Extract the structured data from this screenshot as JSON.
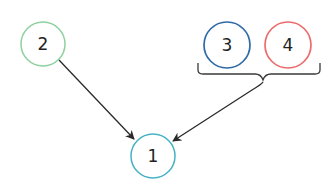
{
  "nodes": [
    {
      "id": "node-1",
      "label": "1",
      "color": "#45b3c4",
      "cx": 153,
      "cy": 156,
      "r": 22
    },
    {
      "id": "node-2",
      "label": "2",
      "color": "#8fd19e",
      "cx": 43,
      "cy": 44,
      "r": 22
    },
    {
      "id": "node-3",
      "label": "3",
      "color": "#2e6aa6",
      "cx": 227,
      "cy": 45,
      "r": 23
    },
    {
      "id": "node-4",
      "label": "4",
      "color": "#ec6b6b",
      "cx": 288,
      "cy": 45,
      "r": 23
    }
  ],
  "edges": [
    {
      "from": "node-2",
      "to": "node-1"
    },
    {
      "from": "group-3-4",
      "to": "node-1"
    }
  ],
  "colors": {
    "edge": "#2a2a2a",
    "brace": "#3a3a3a"
  }
}
